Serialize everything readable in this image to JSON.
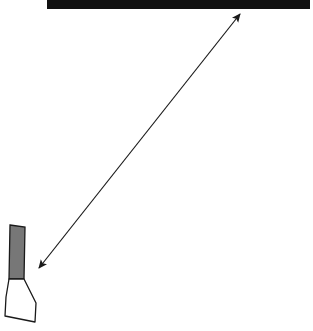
{
  "diagram": {
    "type": "line-drawing",
    "elements": [
      {
        "name": "top-bar",
        "shape": "rectangle",
        "fill": "#111111"
      },
      {
        "name": "double-arrow",
        "shape": "double-headed-arrow",
        "from": [
          37,
          270
        ],
        "to": [
          242,
          12
        ],
        "stroke": "#222222"
      },
      {
        "name": "container-object",
        "shape": "tube-like outline",
        "upper_fill": "#777777",
        "lower_fill": "#ffffff",
        "stroke": "#111111"
      }
    ],
    "colors": {
      "bar": "#111111",
      "gray_fill": "#777777",
      "stroke": "#1a1a1a",
      "background": "#ffffff"
    }
  }
}
